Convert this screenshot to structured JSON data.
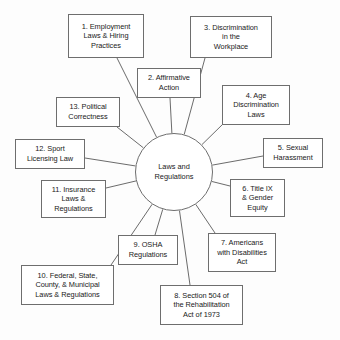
{
  "diagram": {
    "type": "radial-hub-and-spoke",
    "hub": {
      "label": "Laws and\nRegulations",
      "cx": 174,
      "cy": 172,
      "r": 39
    },
    "nodes": [
      {
        "id": 1,
        "label": "1. Employment\nLaws & Hiring\nPractices",
        "x": 68,
        "y": 14,
        "w": 76,
        "h": 44,
        "anchor_x": 117,
        "anchor_y": 58
      },
      {
        "id": 2,
        "label": "2. Affirmative\nAction",
        "x": 137,
        "y": 68,
        "w": 64,
        "h": 30,
        "anchor_x": 170,
        "anchor_y": 98
      },
      {
        "id": 3,
        "label": "3. Discrimination\nin the\nWorkplace",
        "x": 190,
        "y": 16,
        "w": 82,
        "h": 42,
        "anchor_x": 205,
        "anchor_y": 58
      },
      {
        "id": 4,
        "label": "4. Age\nDiscrimination\nLaws",
        "x": 222,
        "y": 85,
        "w": 68,
        "h": 40,
        "anchor_x": 224,
        "anchor_y": 123
      },
      {
        "id": 5,
        "label": "5. Sexual\nHarassment",
        "x": 263,
        "y": 138,
        "w": 60,
        "h": 30,
        "anchor_x": 263,
        "anchor_y": 156
      },
      {
        "id": 6,
        "label": "6. Title IX\n& Gender\nEquity",
        "x": 230,
        "y": 179,
        "w": 55,
        "h": 38,
        "anchor_x": 230,
        "anchor_y": 186
      },
      {
        "id": 7,
        "label": "7. Americans\nwith Disabilities\nAct",
        "x": 208,
        "y": 233,
        "w": 68,
        "h": 39,
        "anchor_x": 215,
        "anchor_y": 233
      },
      {
        "id": 8,
        "label": "8. Section 504 of\nthe Rehabilitation\nAct of 1973",
        "x": 160,
        "y": 285,
        "w": 83,
        "h": 40,
        "anchor_x": 190,
        "anchor_y": 285
      },
      {
        "id": 9,
        "label": "9. OSHA\nRegulations",
        "x": 118,
        "y": 235,
        "w": 60,
        "h": 30,
        "anchor_x": 155,
        "anchor_y": 235
      },
      {
        "id": 10,
        "label": "10. Federal, State,\nCounty, & Municipal\nLaws & Regulations",
        "x": 21,
        "y": 265,
        "w": 93,
        "h": 40,
        "anchor_x": 111,
        "anchor_y": 265
      },
      {
        "id": 11,
        "label": "11. Insurance\nLaws &\nRegulations",
        "x": 41,
        "y": 180,
        "w": 65,
        "h": 38,
        "anchor_x": 106,
        "anchor_y": 188
      },
      {
        "id": 12,
        "label": "12. Sport\nLicensing Law",
        "x": 15,
        "y": 139,
        "w": 70,
        "h": 30,
        "anchor_x": 85,
        "anchor_y": 158
      },
      {
        "id": 13,
        "label": "13. Political\nCorrectness",
        "x": 56,
        "y": 97,
        "w": 64,
        "h": 30,
        "anchor_x": 117,
        "anchor_y": 127
      }
    ],
    "style": {
      "stroke": "#5a5a5a",
      "stroke_width": 0.9,
      "box_border": "#6e6e6e",
      "text_color": "#1a1a1a",
      "background": "#fdfdfd"
    }
  }
}
